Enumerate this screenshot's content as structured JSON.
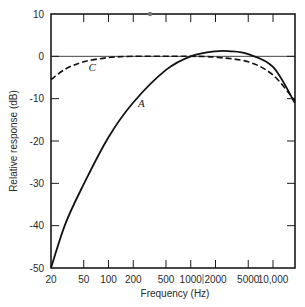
{
  "chart_data": {
    "type": "line",
    "title": "",
    "xlabel": "Frequency (Hz)",
    "ylabel": "Relative response (dB)",
    "xscale": "log",
    "xlim": [
      20,
      18400
    ],
    "ylim": [
      -50,
      10
    ],
    "grid": false,
    "legend": "inline curve labels",
    "x_ticks": [
      20,
      50,
      100,
      200,
      500,
      1000,
      2000,
      5000,
      10000
    ],
    "x_tick_labels": [
      "20",
      "50",
      "100",
      "200",
      "500",
      "1000",
      "2000",
      "5000",
      "10,000"
    ],
    "y_ticks": [
      10,
      0,
      -10,
      -20,
      -30,
      -40,
      -50
    ],
    "y_tick_labels": [
      "10",
      "0",
      "-10",
      "-20",
      "-30",
      "-40",
      "-50"
    ],
    "reference_line_db": 0,
    "series": [
      {
        "name": "A",
        "style": "solid",
        "x": [
          20,
          30,
          50,
          100,
          200,
          500,
          1000,
          2000,
          3000,
          5000,
          10000,
          18400
        ],
        "values": [
          -50,
          -39.5,
          -30.2,
          -19.1,
          -10.9,
          -3.2,
          0,
          1.2,
          1.2,
          0.5,
          -2.5,
          -11
        ]
      },
      {
        "name": "C",
        "style": "dashed",
        "x": [
          20,
          30,
          50,
          100,
          200,
          500,
          1000,
          2000,
          5000,
          10000,
          18400
        ],
        "values": [
          -5.5,
          -3,
          -1.3,
          -0.3,
          0,
          0,
          0,
          -0.2,
          -1.3,
          -4.4,
          -10.5
        ]
      }
    ],
    "annotations": [
      {
        "text": "A",
        "x": 400,
        "y": -11
      },
      {
        "text": "C",
        "x": 100,
        "y": -2.5
      }
    ]
  }
}
